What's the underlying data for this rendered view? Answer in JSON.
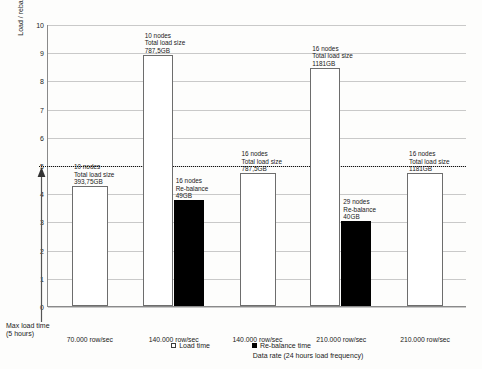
{
  "chart_data": {
    "type": "bar",
    "title": "",
    "xlabel": "Data rate (24 hours load frequency)",
    "ylabel": "Load / rebalance time (hours)",
    "ylim": [
      0,
      10
    ],
    "yticks": [
      0,
      1,
      2,
      3,
      4,
      5,
      6,
      7,
      8,
      9,
      10
    ],
    "ytick_labels": [
      "0",
      "1",
      "2",
      "3",
      "4",
      "5",
      "6",
      "7",
      "8",
      "9",
      "10"
    ],
    "grid": true,
    "legend_position": "bottom-center",
    "categories": [
      "70.000 row/sec",
      "140.000 row/sec",
      "140.000 row/sec",
      "210.000 row/sec",
      "210.000 row/sec"
    ],
    "series": [
      {
        "name": "Load time",
        "color": "#ffffff",
        "values": [
          4.25,
          8.9,
          4.7,
          8.45,
          4.7
        ]
      },
      {
        "name": "Re-balance time",
        "color": "#000000",
        "values": [
          null,
          3.75,
          null,
          3.0,
          null
        ]
      }
    ],
    "bars": [
      {
        "group": "70.000 row/sec",
        "kind": "load",
        "value": 4.25,
        "note": [
          "10 nodes",
          "Total load size",
          "393,75GB"
        ]
      },
      {
        "group": "140.000 row/sec",
        "kind": "load",
        "value": 8.9,
        "note": [
          "10 nodes",
          "Total load size",
          "787,5GB"
        ]
      },
      {
        "group": "140.000 row/sec",
        "kind": "rebalance",
        "value": 3.75,
        "note": [
          "16 nodes",
          "Re-balance",
          "49GB"
        ]
      },
      {
        "group": "140.000 row/sec",
        "kind": "load",
        "value": 4.7,
        "note": [
          "16 nodes",
          "Total load size",
          "787,5GB"
        ]
      },
      {
        "group": "210.000 row/sec",
        "kind": "load",
        "value": 8.45,
        "note": [
          "16 nodes",
          "Total load size",
          "1181GB"
        ]
      },
      {
        "group": "210.000 row/sec",
        "kind": "rebalance",
        "value": 3.0,
        "note": [
          "29 nodes",
          "Re-balance",
          "40GB"
        ]
      },
      {
        "group": "210.000 row/sec",
        "kind": "load",
        "value": 4.7,
        "note": [
          "16 nodes",
          "Total load size",
          "1181GB"
        ]
      }
    ],
    "annotations": [
      {
        "name": "max-load-time",
        "value": 5,
        "line_style": "dotted",
        "label_line1": "Max load time",
        "label_line2": "(5 hours)"
      }
    ]
  },
  "axis": {
    "y_title": "Load / rebalance time (hours)",
    "x_title": "Data rate (24 hours load frequency)",
    "y_ticks": [
      "10",
      "9",
      "8",
      "7",
      "6",
      "5",
      "4",
      "3",
      "2",
      "1",
      "0"
    ]
  },
  "categories": [
    {
      "label": "70.000 row/sec"
    },
    {
      "label": "140.000 row/sec"
    },
    {
      "label": "140.000 row/sec"
    },
    {
      "label": "210.000 row/sec"
    },
    {
      "label": "210.000 row/sec"
    }
  ],
  "notes": [
    {
      "l1": "10 nodes",
      "l2": "Total load size",
      "l3": "393,75GB"
    },
    {
      "l1": "10 nodes",
      "l2": "Total load size",
      "l3": "787,5GB"
    },
    {
      "l1": "16 nodes",
      "l2": "Re-balance",
      "l3": "49GB"
    },
    {
      "l1": "16 nodes",
      "l2": "Total load size",
      "l3": "787,5GB"
    },
    {
      "l1": "16 nodes",
      "l2": "Total load size",
      "l3": "1181GB"
    },
    {
      "l1": "29 nodes",
      "l2": "Re-balance",
      "l3": "40GB"
    },
    {
      "l1": "16 nodes",
      "l2": "Total load size",
      "l3": "1181GB"
    }
  ],
  "max_load": {
    "line1": "Max load time",
    "line2": "(5 hours)"
  },
  "legend": {
    "items": [
      {
        "label": "Load time",
        "swatch": "white-square"
      },
      {
        "label": "Re-balance time",
        "swatch": "black-square"
      }
    ]
  }
}
